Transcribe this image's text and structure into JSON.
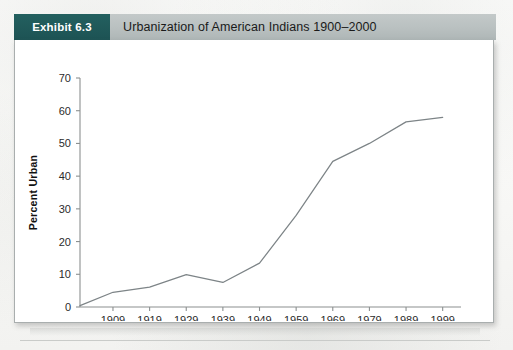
{
  "exhibit": {
    "badge_label": "Exhibit 6.3",
    "title": "Urbanization of American Indians 1900–2000"
  },
  "chart_data": {
    "type": "line",
    "title": "Urbanization of American Indians 1900–2000",
    "xlabel": "",
    "ylabel": "Percent Urban",
    "x": [
      1900,
      1909,
      1919,
      1929,
      1939,
      1949,
      1959,
      1969,
      1979,
      1989,
      1999
    ],
    "values": [
      0.4,
      4.5,
      6.1,
      9.9,
      7.5,
      13.4,
      28.0,
      44.5,
      50.0,
      56.6,
      58.0
    ],
    "series": [
      {
        "name": "Percent Urban",
        "values": [
          0.4,
          4.5,
          6.1,
          9.9,
          7.5,
          13.4,
          28.0,
          44.5,
          50.0,
          56.6,
          58.0
        ]
      }
    ],
    "xtick_labels": [
      "1909",
      "1919",
      "1929",
      "1939",
      "1949",
      "1959",
      "1969",
      "1979",
      "1989",
      "1999"
    ],
    "xtick_values": [
      1909,
      1919,
      1929,
      1939,
      1949,
      1959,
      1969,
      1979,
      1989,
      1999
    ],
    "ytick_labels": [
      "0",
      "10",
      "20",
      "30",
      "40",
      "50",
      "60",
      "70"
    ],
    "ytick_values": [
      0,
      10,
      20,
      30,
      40,
      50,
      60,
      70
    ],
    "xlim": [
      1900,
      2004
    ],
    "ylim": [
      0,
      70
    ],
    "grid": false,
    "legend": false,
    "line_color": "#7d8487"
  },
  "colors": {
    "badge_bg": "#1f5758",
    "header_bg": "#b9c0c0",
    "card_bg": "#ffffff",
    "axis": "#8c9090",
    "line": "#7d8487",
    "page_bg": "#fbfbfa"
  }
}
